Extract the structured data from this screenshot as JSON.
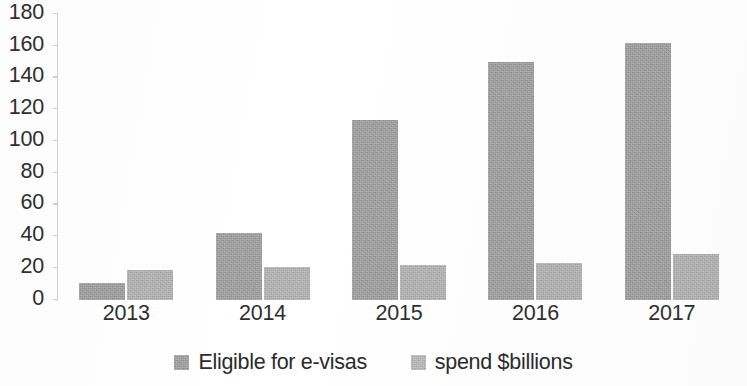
{
  "chart_data": {
    "type": "bar",
    "title": "",
    "subtitle": "",
    "xlabel": "",
    "ylabel": "",
    "categories": [
      "2013",
      "2014",
      "2015",
      "2016",
      "2017"
    ],
    "series": [
      {
        "name": "Eligible for e-visas",
        "color": "#939393",
        "values": [
          11,
          42,
          113,
          150,
          162
        ]
      },
      {
        "name": "spend $billions",
        "color": "#a9a9a9",
        "values": [
          19,
          21,
          22,
          23,
          29
        ]
      }
    ],
    "ylim": [
      0,
      180
    ],
    "ytick_step": 20,
    "yticks": [
      "0",
      "20",
      "40",
      "60",
      "80",
      "100",
      "120",
      "140",
      "160",
      "180"
    ],
    "grid": false,
    "legend_position": "bottom",
    "annotations": []
  },
  "legend": {
    "items": [
      {
        "label": "Eligible for e-visas",
        "swatch": "#939393"
      },
      {
        "label": "spend $billions",
        "swatch": "#b0b0b0"
      }
    ]
  }
}
